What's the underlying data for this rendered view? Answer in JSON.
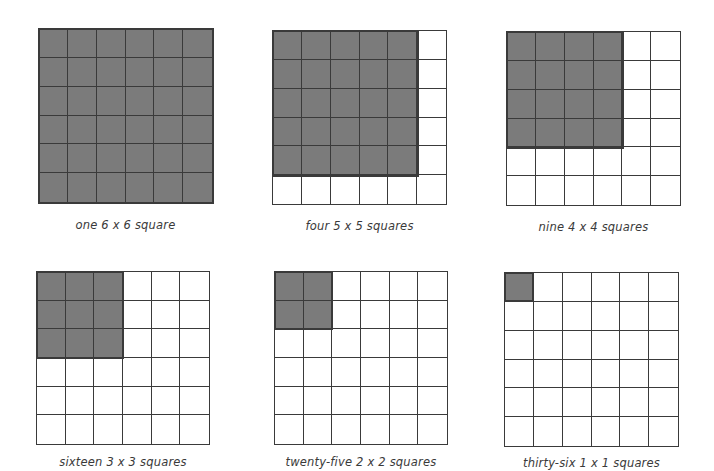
{
  "diagram": {
    "grid_size": 6,
    "colors": {
      "filled": "#7b7b7b",
      "empty": "#ffffff",
      "line": "#3a3a3a"
    },
    "panels": [
      {
        "caption": "one 6 x 6 square",
        "square_size": 6,
        "count": 1,
        "x": 38,
        "y": 28,
        "size": 175,
        "caption_y": 218
      },
      {
        "caption": "four 5 x 5 squares",
        "square_size": 5,
        "count": 4,
        "x": 272,
        "y": 30,
        "size": 175,
        "caption_y": 219
      },
      {
        "caption": "nine 4 x 4 squares",
        "square_size": 4,
        "count": 9,
        "x": 506,
        "y": 31,
        "size": 175,
        "caption_y": 220
      },
      {
        "caption": "sixteen 3 x 3 squares",
        "square_size": 3,
        "count": 16,
        "x": 36,
        "y": 271,
        "size": 174,
        "caption_y": 455
      },
      {
        "caption": "twenty-five 2 x 2 squares",
        "square_size": 2,
        "count": 25,
        "x": 274,
        "y": 271,
        "size": 174,
        "caption_y": 455
      },
      {
        "caption": "thirty-six 1 x 1 squares",
        "square_size": 1,
        "count": 36,
        "x": 504,
        "y": 272,
        "size": 175,
        "caption_y": 456
      }
    ]
  }
}
